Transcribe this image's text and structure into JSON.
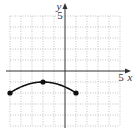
{
  "chart_data": {
    "type": "line",
    "title": "",
    "xlabel": "x",
    "ylabel": "y",
    "xlim": [
      -5,
      5
    ],
    "ylim": [
      -5,
      5
    ],
    "grid": true,
    "grid_style": "dotted",
    "tick_labels": {
      "x": [
        "5"
      ],
      "y": [
        "5"
      ]
    },
    "series": [
      {
        "name": "curve",
        "shape": "downward arc (parabola-like)",
        "x": [
          -5,
          -4,
          -3,
          -2,
          -1,
          0,
          1
        ],
        "y": [
          -2,
          -1.44,
          -1.11,
          -1,
          -1.11,
          -1.44,
          -2
        ],
        "marked_points": [
          {
            "x": -5,
            "y": -2
          },
          {
            "x": -2,
            "y": -1
          },
          {
            "x": 1,
            "y": -2
          }
        ]
      }
    ]
  },
  "labels": {
    "x_axis": "x",
    "y_axis": "y",
    "x_tick": "5",
    "y_tick": "5"
  },
  "colors": {
    "grid": "#9a9a9a",
    "axis": "#333333",
    "curve": "#111111"
  }
}
